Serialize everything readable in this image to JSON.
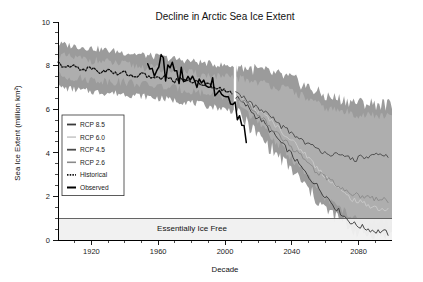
{
  "chart_data": {
    "type": "line",
    "title": "Decline in Arctic Sea Ice Extent",
    "xlabel": "Decade",
    "ylabel": "Sea Ice Extent (million km²)",
    "xlim": [
      1900,
      2100
    ],
    "ylim": [
      0,
      10
    ],
    "grid": false,
    "legend_position": "inner-left",
    "x_ticks_major": [
      1920,
      1960,
      2000,
      2040,
      2080
    ],
    "x_ticks_minor_step": 10,
    "y_ticks_major": [
      0,
      2,
      4,
      6,
      8,
      10
    ],
    "y_ticks_minor_step": 0.5,
    "annotations": [
      {
        "text": "Essentially Ice Free",
        "band_from": 0,
        "band_to": 1.0,
        "color": "#f0f0f0"
      }
    ],
    "colors": {
      "rcp85": "#3a3a3a",
      "rcp60": "#c9c9c9",
      "rcp45": "#4a4a4a",
      "rcp26": "#8a8a8a",
      "historical": "#111111",
      "observed": "#000000",
      "uncertainty_band": "#9b9b9b",
      "uncertainty_band_inner": "#b4b4b4",
      "ice_free_band": "#f0f0f0"
    },
    "series": [
      {
        "name": "RCP 8.5",
        "style": "solid",
        "color": "#3a3a3a",
        "x": [
          2006,
          2010,
          2014,
          2018,
          2022,
          2026,
          2030,
          2034,
          2038,
          2042,
          2046,
          2050,
          2054,
          2058,
          2062,
          2066,
          2070,
          2074,
          2078,
          2082,
          2086,
          2090,
          2094,
          2098
        ],
        "values": [
          6.6,
          6.3,
          6.1,
          5.7,
          5.5,
          5.1,
          4.8,
          4.4,
          4.1,
          3.7,
          3.3,
          2.9,
          2.6,
          2.2,
          1.9,
          1.5,
          1.2,
          0.9,
          0.7,
          0.6,
          0.5,
          0.4,
          0.4,
          0.3
        ]
      },
      {
        "name": "RCP 6.0",
        "style": "solid",
        "color": "#c9c9c9",
        "x": [
          2006,
          2010,
          2014,
          2018,
          2022,
          2026,
          2030,
          2034,
          2038,
          2042,
          2046,
          2050,
          2054,
          2058,
          2062,
          2066,
          2070,
          2074,
          2078,
          2082,
          2086,
          2090,
          2094,
          2098
        ],
        "values": [
          6.7,
          6.5,
          6.3,
          6.0,
          5.8,
          5.6,
          5.3,
          5.0,
          4.7,
          4.4,
          4.1,
          3.8,
          3.4,
          3.1,
          2.8,
          2.5,
          2.2,
          2.0,
          1.8,
          1.7,
          1.6,
          1.5,
          1.4,
          1.4
        ]
      },
      {
        "name": "RCP 4.5",
        "style": "solid",
        "color": "#4a4a4a",
        "x": [
          2006,
          2010,
          2014,
          2018,
          2022,
          2026,
          2030,
          2034,
          2038,
          2042,
          2046,
          2050,
          2054,
          2058,
          2062,
          2066,
          2070,
          2074,
          2078,
          2082,
          2086,
          2090,
          2094,
          2098
        ],
        "values": [
          6.8,
          6.6,
          6.4,
          6.1,
          5.9,
          5.7,
          5.5,
          5.2,
          5.0,
          4.8,
          4.6,
          4.4,
          4.2,
          4.1,
          4.0,
          3.9,
          3.8,
          3.8,
          3.7,
          3.8,
          3.8,
          3.9,
          3.8,
          3.9
        ]
      },
      {
        "name": "RCP 2.6",
        "style": "solid",
        "color": "#8a8a8a",
        "x": [
          2006,
          2010,
          2014,
          2018,
          2022,
          2026,
          2030,
          2034,
          2038,
          2042,
          2046,
          2050,
          2054,
          2058,
          2062,
          2066,
          2070,
          2074,
          2078,
          2082,
          2086,
          2090,
          2094,
          2098
        ],
        "values": [
          6.6,
          6.4,
          6.2,
          5.9,
          5.6,
          5.3,
          5.0,
          4.7,
          4.4,
          4.1,
          3.8,
          3.5,
          3.2,
          3.0,
          2.8,
          2.6,
          2.4,
          2.2,
          2.1,
          2.0,
          2.0,
          1.9,
          1.9,
          1.8
        ]
      },
      {
        "name": "Historical",
        "style": "dotted",
        "color": "#111111",
        "x": [
          1900,
          1905,
          1910,
          1915,
          1920,
          1925,
          1930,
          1935,
          1940,
          1945,
          1950,
          1955,
          1960,
          1965,
          1970,
          1975,
          1980,
          1985,
          1990,
          1995,
          2000,
          2005
        ],
        "values": [
          8.1,
          7.9,
          8.0,
          7.8,
          7.9,
          7.7,
          7.8,
          7.6,
          7.7,
          7.5,
          7.6,
          7.5,
          7.4,
          7.5,
          7.3,
          7.4,
          7.3,
          7.2,
          7.1,
          7.0,
          6.9,
          6.7
        ]
      },
      {
        "name": "Observed",
        "style": "solid",
        "color": "#000000",
        "x": [
          1953,
          1956,
          1959,
          1962,
          1965,
          1968,
          1971,
          1974,
          1977,
          1980,
          1983,
          1986,
          1989,
          1992,
          1995,
          1998,
          2001,
          2004,
          2007,
          2010,
          2013
        ],
        "values": [
          7.6,
          7.9,
          7.5,
          8.2,
          7.6,
          8.0,
          7.4,
          7.6,
          7.3,
          7.5,
          7.2,
          7.4,
          6.9,
          7.2,
          6.6,
          6.9,
          6.3,
          6.6,
          5.6,
          5.4,
          4.8
        ]
      }
    ],
    "uncertainty_band": {
      "x": [
        1900,
        1920,
        1940,
        1960,
        1980,
        2000,
        2006,
        2020,
        2040,
        2060,
        2080,
        2100
      ],
      "upper": [
        9.0,
        8.8,
        8.6,
        8.4,
        8.2,
        8.0,
        8.0,
        7.8,
        7.4,
        6.6,
        6.3,
        6.2
      ],
      "lower": [
        7.0,
        6.8,
        6.7,
        6.5,
        6.3,
        6.0,
        5.9,
        4.8,
        3.2,
        1.4,
        0.3,
        0.2
      ]
    }
  },
  "legend": {
    "items": [
      {
        "label": "RCP 8.5",
        "style": "solid",
        "color": "#3a3a3a",
        "width": 1.8
      },
      {
        "label": "RCP 6.0",
        "style": "solid",
        "color": "#c9c9c9",
        "width": 1.6
      },
      {
        "label": "RCP 4.5",
        "style": "solid",
        "color": "#4a4a4a",
        "width": 1.8
      },
      {
        "label": "RCP 2.6",
        "style": "solid",
        "color": "#8a8a8a",
        "width": 1.6
      },
      {
        "label": "Historical",
        "style": "dotted",
        "color": "#111111",
        "width": 1.6
      },
      {
        "label": "Observed",
        "style": "solid",
        "color": "#000000",
        "width": 2.0
      }
    ]
  }
}
